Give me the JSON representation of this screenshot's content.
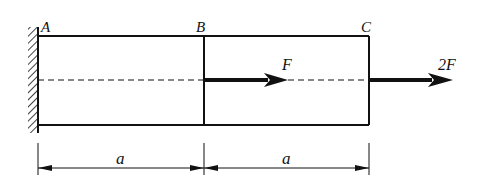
{
  "diagram": {
    "type": "axially loaded stepped bar fixed at left wall",
    "points": {
      "A": "A",
      "B": "B",
      "C": "C"
    },
    "loads": {
      "at_B": "F",
      "at_C": "2F"
    },
    "dimensions": {
      "AB": "a",
      "BC": "a"
    },
    "support": "fixed-wall",
    "colors": {
      "stroke": "#111111",
      "background": "#ffffff"
    }
  }
}
